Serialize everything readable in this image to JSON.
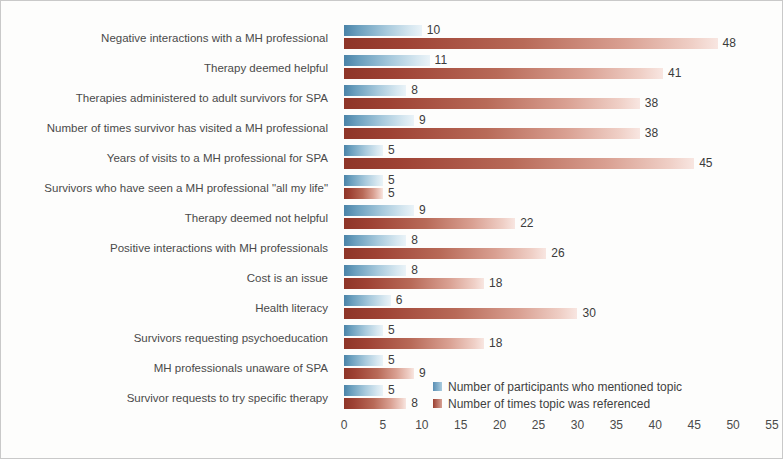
{
  "chart_data": {
    "type": "bar",
    "orientation": "horizontal",
    "title": "",
    "xlabel": "",
    "ylabel": "",
    "xlim": [
      0,
      55
    ],
    "xticks": [
      0,
      5,
      10,
      15,
      20,
      25,
      30,
      35,
      40,
      45,
      50,
      55
    ],
    "grid": false,
    "legend_position": "bottom-right",
    "categories": [
      "Negative interactions with a MH professional",
      "Therapy deemed helpful",
      "Therapies administered to adult survivors for SPA",
      "Number of times survivor has visited a MH professional",
      "Years of visits to a MH professional for SPA",
      "Survivors who have seen a MH professional \"all my life\"",
      "Therapy deemed not helpful",
      "Positive interactions with MH professionals",
      "Cost is an issue",
      "Health literacy",
      "Survivors requesting psychoeducation",
      "MH professionals unaware of SPA",
      "Survivor requests to try specific therapy"
    ],
    "series": [
      {
        "name": "Number of participants who mentioned topic",
        "color": "#5a8fb4",
        "values": [
          10,
          11,
          8,
          9,
          5,
          5,
          9,
          8,
          8,
          6,
          5,
          5,
          5
        ]
      },
      {
        "name": "Number of times topic was referenced",
        "color": "#9b4032",
        "values": [
          48,
          41,
          38,
          38,
          45,
          5,
          22,
          26,
          18,
          30,
          18,
          9,
          8
        ]
      }
    ]
  },
  "legend": {
    "items": [
      {
        "label": "Number of participants who mentioned topic"
      },
      {
        "label": "Number of times topic was referenced"
      }
    ]
  }
}
